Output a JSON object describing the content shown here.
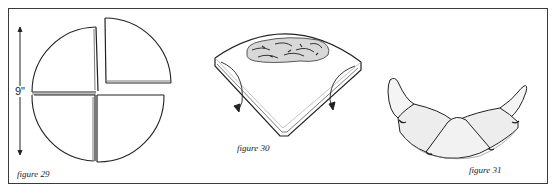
{
  "figures": [
    {
      "id": "figure-29",
      "caption": "figure 29",
      "dimension_label": "9\"",
      "description": "Circle divided into four quarter segments, upper-right quarter separated"
    },
    {
      "id": "figure-30",
      "caption": "figure 30",
      "description": "Quarter wedge with filling in the center and arrows showing sides folded under"
    },
    {
      "id": "figure-31",
      "caption": "figure 31",
      "description": "Folded crescent-shaped pastry with pointed ends"
    }
  ],
  "colors": {
    "ink": "#222222",
    "frame": "#3a3a3a",
    "background": "#ffffff"
  }
}
